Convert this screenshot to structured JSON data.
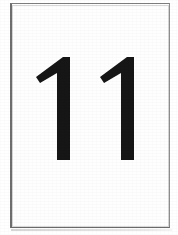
{
  "image": {
    "kind": "scanned-number-card",
    "width": 178,
    "height": 235,
    "description": "Scanned white card with a thin ruled rectangular border containing the large printed number 11"
  },
  "card": {
    "background_color": "#fefefe",
    "outer_background_color": "#ffffff",
    "border": {
      "color": "#717171",
      "halo_color": "#d8d8d8",
      "thickness_px": 2,
      "left_px": 10,
      "top_px": 3,
      "width_px": 160,
      "height_px": 225
    }
  },
  "numeral": {
    "value": "11",
    "digits": [
      {
        "glyph": "1",
        "index": 1
      },
      {
        "glyph": "1",
        "index": 2
      }
    ],
    "ink_color": "#141414",
    "style": "bold sans-serif, angled top flag, no base serif",
    "alignment": "centered",
    "cap_top_px": 57,
    "baseline_px": 160
  }
}
